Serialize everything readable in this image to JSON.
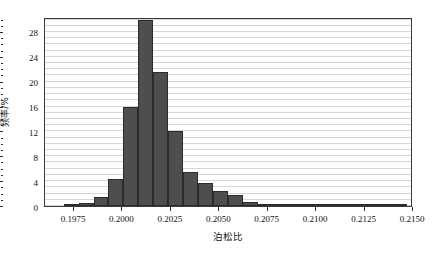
{
  "chart_data": {
    "type": "bar",
    "title": "",
    "subtitle": "",
    "xlabel": "泊松比",
    "ylabel": "频率/%",
    "xlim": [
      0.196,
      0.215
    ],
    "ylim": [
      0,
      30.4
    ],
    "grid": "horizontal",
    "legend": "none",
    "bar_color": "#4e4e4e",
    "bar_edge_color": "#2b2b2b",
    "grid_color": "#d6d6d6",
    "frame_color": "#3a3a3a",
    "bin_width": 0.00077,
    "xticks": [
      0.1975,
      0.2,
      0.2025,
      0.205,
      0.2075,
      0.21,
      0.2125,
      0.215
    ],
    "xtick_labels": [
      "0.1975",
      "0.2000",
      "0.2025",
      "0.2050",
      "0.2075",
      "0.2100",
      "0.2125",
      "0.2150"
    ],
    "yticks": [
      0,
      4,
      8,
      12,
      16,
      20,
      24,
      28
    ],
    "ytick_labels": [
      "0",
      "4",
      "8",
      "12",
      "16",
      "20",
      "24",
      "28"
    ],
    "yticks_minor_step": 1,
    "bin_centers": [
      0.19735,
      0.19812,
      0.19889,
      0.19966,
      0.20043,
      0.2012,
      0.20197,
      0.20274,
      0.20351,
      0.20428,
      0.20505,
      0.20582,
      0.20659,
      0.20736,
      0.20813,
      0.2089,
      0.20967,
      0.21044,
      0.21121,
      0.21198,
      0.21275,
      0.21352,
      0.21429
    ],
    "values": [
      0.2,
      0.5,
      1.4,
      4.4,
      16.0,
      30.0,
      21.5,
      12.1,
      5.5,
      3.7,
      2.4,
      1.7,
      0.7,
      0.3,
      0.2,
      0.2,
      0.2,
      0.1,
      0.1,
      0.1,
      0.1,
      0.1,
      0.1
    ],
    "peak_value": 30.0,
    "peak_bin_center": 0.2012,
    "n_bins": 23
  }
}
